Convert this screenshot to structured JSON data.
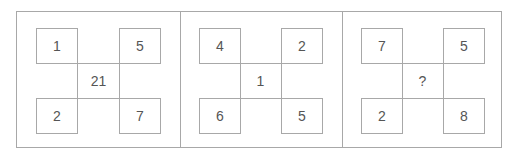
{
  "puzzle": {
    "panels": [
      {
        "top_left": "1",
        "top_right": "5",
        "center": "21",
        "bottom_left": "2",
        "bottom_right": "7"
      },
      {
        "top_left": "4",
        "top_right": "2",
        "center": "1",
        "bottom_left": "6",
        "bottom_right": "5"
      },
      {
        "top_left": "7",
        "top_right": "5",
        "center": "?",
        "bottom_left": "2",
        "bottom_right": "8"
      }
    ]
  }
}
